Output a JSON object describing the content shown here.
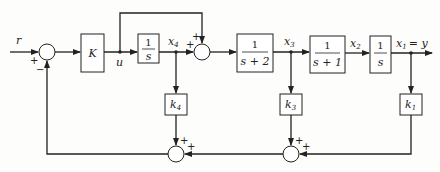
{
  "diagram": {
    "type": "control-system-block-diagram",
    "signals": {
      "input": "r",
      "u": "u",
      "x4": "x",
      "x4_sub": "4",
      "x3": "x",
      "x3_sub": "3",
      "x2": "x",
      "x2_sub": "2",
      "x1_label": "x",
      "x1_sub": "1",
      "x1_eq": "= y"
    },
    "blocks": {
      "gain_K": "K",
      "integrator1": {
        "num": "1",
        "den": "s"
      },
      "lag2": {
        "num": "1",
        "den": "s + 2"
      },
      "lag1": {
        "num": "1",
        "den": "s + 1"
      },
      "integrator2": {
        "num": "1",
        "den": "s"
      },
      "k4": {
        "name": "k",
        "sub": "4"
      },
      "k3": {
        "name": "k",
        "sub": "3"
      },
      "k1": {
        "name": "k",
        "sub": "1"
      }
    },
    "signs": {
      "sum1_ref": "+",
      "sum1_fb": "−",
      "sum2_x4": "+",
      "sum2_bypass": "+",
      "sum3_k4": "+",
      "sum3_right": "+",
      "sum4_k3": "+",
      "sum4_k1": "+"
    }
  }
}
